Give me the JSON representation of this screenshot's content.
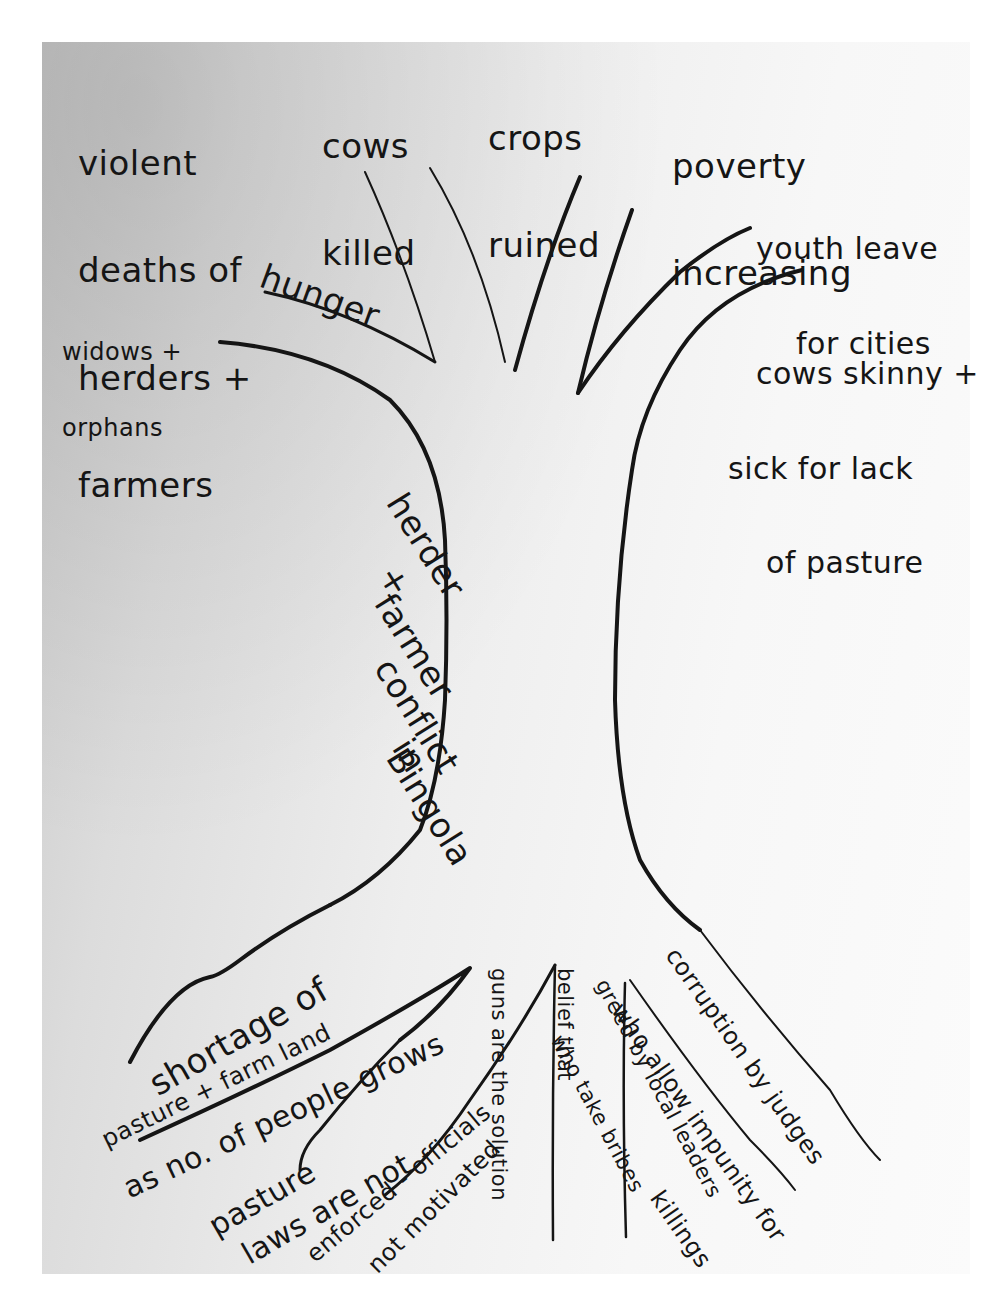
{
  "diagram": {
    "type": "conflict-tree",
    "trunk": {
      "label_lines": [
        "herder",
        "+",
        "farmer",
        "conflict",
        "in",
        "Bingola"
      ],
      "role": "core problem"
    },
    "branches": [
      {
        "id": "violent-deaths",
        "lines": [
          "violent",
          "deaths of",
          "herders +",
          "farmers"
        ]
      },
      {
        "id": "cows-killed",
        "lines": [
          "cows",
          "killed"
        ]
      },
      {
        "id": "crops-ruined",
        "lines": [
          "crops",
          "ruined"
        ]
      },
      {
        "id": "poverty",
        "lines": [
          "poverty",
          "increasing"
        ]
      },
      {
        "id": "youth-leave",
        "lines": [
          "youth leave",
          "for cities"
        ]
      },
      {
        "id": "hunger",
        "lines": [
          "hunger"
        ]
      },
      {
        "id": "widows-orphans",
        "lines": [
          "widows +",
          "orphans"
        ]
      },
      {
        "id": "cows-skinny",
        "lines": [
          "cows skinny +",
          "sick for lack",
          "of pasture"
        ]
      }
    ],
    "roots": [
      {
        "id": "land-shortage",
        "lines": [
          "shortage of",
          "pasture + farm land",
          "as no. of people grows"
        ]
      },
      {
        "id": "pasture-laws",
        "lines": [
          "pasture",
          "laws are not",
          "enforced - officials",
          "not motivated"
        ]
      },
      {
        "id": "guns-belief",
        "lines": [
          "belief that",
          "guns are the solution"
        ]
      },
      {
        "id": "local-greed",
        "lines": [
          "greed by local leaders",
          "who take bribes"
        ]
      },
      {
        "id": "judge-corruption",
        "lines": [
          "corruption by judges",
          "who allow impunity for",
          "killings"
        ]
      }
    ]
  },
  "colors": {
    "ink": "#151515",
    "paper_light": "#fbfbfb",
    "paper_dark": "#c9c9c9",
    "background": "#ffffff"
  }
}
